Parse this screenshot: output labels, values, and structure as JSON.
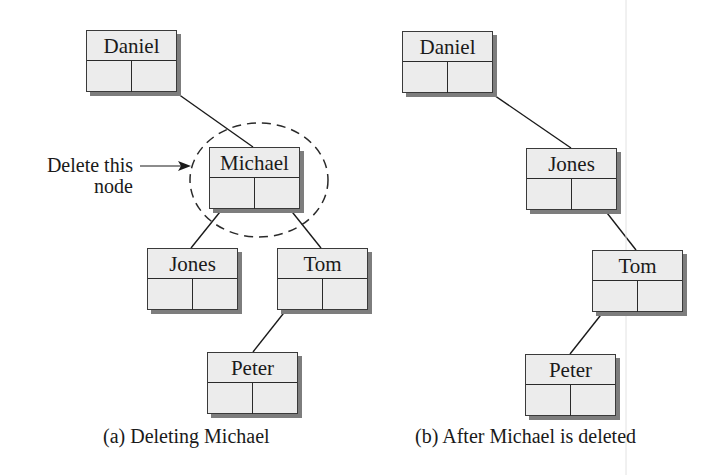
{
  "panel_a": {
    "caption": "(a) Deleting Michael",
    "annotation": {
      "line1": "Delete this",
      "line2": "node"
    },
    "nodes": [
      {
        "name": "Daniel"
      },
      {
        "name": "Michael"
      },
      {
        "name": "Jones"
      },
      {
        "name": "Tom"
      },
      {
        "name": "Peter"
      }
    ],
    "edges": [
      [
        "Daniel",
        "Michael"
      ],
      [
        "Michael",
        "Jones"
      ],
      [
        "Michael",
        "Tom"
      ],
      [
        "Tom",
        "Peter"
      ]
    ]
  },
  "panel_b": {
    "caption": "(b) After Michael is deleted",
    "nodes": [
      {
        "name": "Daniel"
      },
      {
        "name": "Jones"
      },
      {
        "name": "Tom"
      },
      {
        "name": "Peter"
      }
    ],
    "edges": [
      [
        "Daniel",
        "Jones"
      ],
      [
        "Jones",
        "Tom"
      ],
      [
        "Tom",
        "Peter"
      ]
    ]
  },
  "colors": {
    "node_fill": "#ececec",
    "shadow": "#7d7d7d",
    "line": "#1a1a1a"
  }
}
